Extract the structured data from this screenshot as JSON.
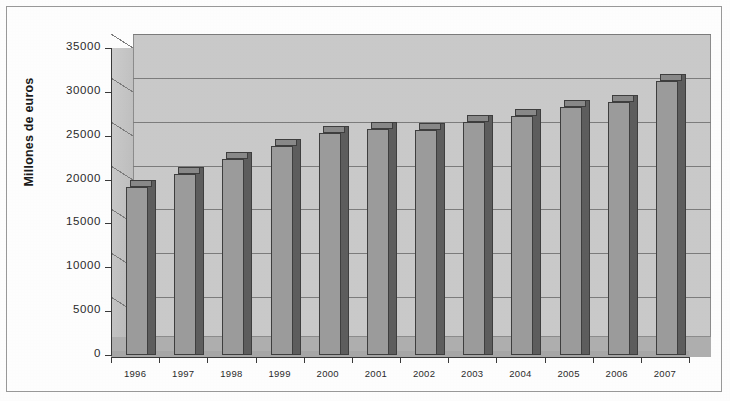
{
  "chart_data": {
    "type": "bar",
    "title": "",
    "subtitle": "",
    "xlabel": "",
    "ylabel": "Millones de euros",
    "categories": [
      "1996",
      "1997",
      "1998",
      "1999",
      "2000",
      "2001",
      "2002",
      "2003",
      "2004",
      "2005",
      "2006",
      "2007"
    ],
    "values": [
      19200,
      20600,
      22300,
      23800,
      25300,
      25800,
      25700,
      26600,
      27200,
      28300,
      28800,
      31200
    ],
    "series": [
      {
        "name": "Millones de euros",
        "values": [
          19200,
          20600,
          22300,
          23800,
          25300,
          25800,
          25700,
          26600,
          27200,
          28300,
          28800,
          31200
        ]
      }
    ],
    "ylim": [
      0,
      35000
    ],
    "ytick_labels": [
      "0",
      "5000",
      "10000",
      "15000",
      "20000",
      "25000",
      "30000",
      "35000"
    ],
    "ytick_values": [
      0,
      5000,
      10000,
      15000,
      20000,
      25000,
      30000,
      35000
    ],
    "grid": true,
    "legend": false,
    "legend_position": "none",
    "style": "3d-column",
    "colors": {
      "bar_front": "#9d9d9d",
      "bar_side": "#5e5e5e",
      "bar_top": "#8a8a8a",
      "bar_outline": "#3f3f3f",
      "plot_wall": "#cbcbcb",
      "floor": "#b0b0b0",
      "gridline": "#7d7d7d",
      "axis": "#3a3a3a",
      "frame_border": "#9a9a9a",
      "text": "#2b2b2b",
      "background": "#ffffff"
    }
  }
}
